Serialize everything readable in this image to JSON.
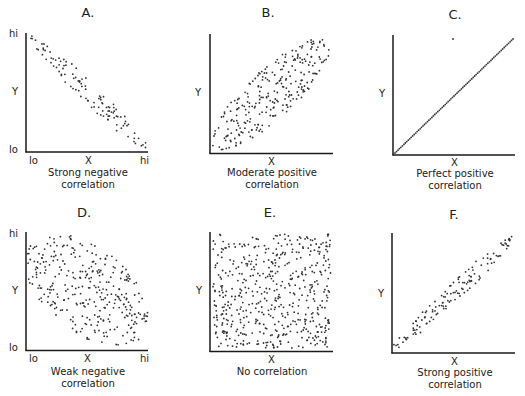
{
  "colors": {
    "axis": "#1a1a1a",
    "dot": "#333333",
    "background": "#ffffff"
  },
  "panels": [
    {
      "id": "A",
      "title": "A.",
      "caption_line1": "Strong negative",
      "caption_line2": "correlation",
      "y_label": "Y",
      "x_label": "X",
      "y_hi": "hi",
      "y_lo": "lo",
      "x_lo": "lo",
      "x_hi": "hi"
    },
    {
      "id": "B",
      "title": "B.",
      "caption_line1": "Moderate positive",
      "caption_line2": "correlation",
      "y_label": "Y",
      "x_label": "X"
    },
    {
      "id": "C",
      "title": "C.",
      "caption_line1": "Perfect positive",
      "caption_line2": "correlation",
      "y_label": "Y",
      "x_label": "X"
    },
    {
      "id": "D",
      "title": "D.",
      "caption_line1": "Weak negative",
      "caption_line2": "correlation",
      "y_label": "Y",
      "x_label": "X",
      "y_hi": "hi",
      "y_lo": "lo",
      "x_lo": "lo",
      "x_hi": "hi"
    },
    {
      "id": "E",
      "title": "E.",
      "caption_line1": "No correlation",
      "caption_line2": "",
      "y_label": "Y",
      "x_label": "X"
    },
    {
      "id": "F",
      "title": "F.",
      "caption_line1": "Strong positive",
      "caption_line2": "correlation",
      "y_label": "Y",
      "x_label": "X"
    }
  ],
  "chart_data": [
    {
      "type": "scatter",
      "title": "A.",
      "subtitle": "Strong negative correlation",
      "xlabel": "X",
      "ylabel": "Y",
      "x_ticks": [
        "lo",
        "hi"
      ],
      "y_ticks": [
        "lo",
        "hi"
      ],
      "pattern": "narrow band, top-left to bottom-right",
      "r_approx": -0.9
    },
    {
      "type": "scatter",
      "title": "B.",
      "subtitle": "Moderate positive correlation",
      "xlabel": "X",
      "ylabel": "Y",
      "pattern": "wide elliptical band, bottom-left to top-right",
      "r_approx": 0.6
    },
    {
      "type": "scatter",
      "title": "C.",
      "subtitle": "Perfect positive correlation",
      "xlabel": "X",
      "ylabel": "Y",
      "pattern": "points on a straight diagonal line",
      "r_approx": 1.0
    },
    {
      "type": "scatter",
      "title": "D.",
      "subtitle": "Weak negative correlation",
      "xlabel": "X",
      "ylabel": "Y",
      "x_ticks": [
        "lo",
        "hi"
      ],
      "y_ticks": [
        "lo",
        "hi"
      ],
      "pattern": "broad oval cloud, top-left to bottom-right",
      "r_approx": -0.4
    },
    {
      "type": "scatter",
      "title": "E.",
      "subtitle": "No correlation",
      "xlabel": "X",
      "ylabel": "Y",
      "pattern": "uniform random fill of the plot area",
      "r_approx": 0.0
    },
    {
      "type": "scatter",
      "title": "F.",
      "subtitle": "Strong positive correlation",
      "xlabel": "X",
      "ylabel": "Y",
      "pattern": "narrow band, bottom-left to top-right",
      "r_approx": 0.9
    }
  ]
}
